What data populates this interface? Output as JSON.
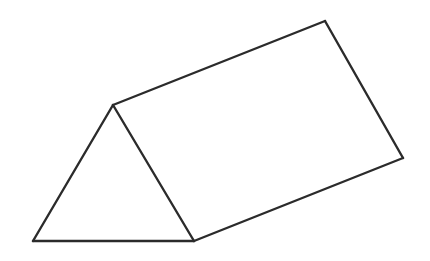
{
  "figure": {
    "type": "geometric-line-drawing",
    "shape_name": "triangular-prism",
    "canvas": {
      "width": 430,
      "height": 261,
      "background_color": "#ffffff"
    },
    "style": {
      "stroke_color": "#2b2b2b",
      "stroke_width": 2.4,
      "fill_color": "#ffffff",
      "line_cap": "round",
      "line_join": "round"
    },
    "vertices": {
      "apex_front": {
        "name": "triangle-apex",
        "x": 113,
        "y": 105
      },
      "bottom_left_front": {
        "name": "triangle-bottom-left",
        "x": 33,
        "y": 241
      },
      "bottom_right_front": {
        "name": "triangle-bottom-right",
        "x": 194,
        "y": 241
      },
      "apex_back": {
        "name": "prism-top-back",
        "x": 325,
        "y": 21
      },
      "bottom_right_back": {
        "name": "prism-bottom-back",
        "x": 403,
        "y": 158
      }
    },
    "faces": [
      {
        "name": "triangular-end-face",
        "points": "113,105 33,241 194,241",
        "fill": "#ffffff"
      },
      {
        "name": "rectangular-top-face",
        "points": "113,105 325,21 403,158 194,241",
        "fill": "#ffffff"
      }
    ],
    "edges": [
      {
        "name": "edge-apex-to-bottom-left",
        "x1": 113,
        "y1": 105,
        "x2": 33,
        "y2": 241
      },
      {
        "name": "edge-bottom-left-to-bottom-right",
        "x1": 33,
        "y1": 241,
        "x2": 194,
        "y2": 241
      },
      {
        "name": "edge-bottom-right-to-apex",
        "x1": 194,
        "y1": 241,
        "x2": 113,
        "y2": 105
      },
      {
        "name": "edge-apex-to-top-back",
        "x1": 113,
        "y1": 105,
        "x2": 325,
        "y2": 21
      },
      {
        "name": "edge-top-back-to-bottom-back",
        "x1": 325,
        "y1": 21,
        "x2": 403,
        "y2": 158
      },
      {
        "name": "edge-bottom-back-to-bottom-right",
        "x1": 403,
        "y1": 158,
        "x2": 194,
        "y2": 241
      }
    ]
  }
}
